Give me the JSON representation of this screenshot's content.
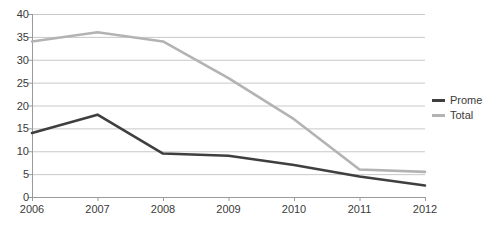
{
  "chart_data": {
    "type": "line",
    "title": "",
    "xlabel": "",
    "ylabel": "",
    "categories": [
      "2006",
      "2007",
      "2008",
      "2009",
      "2010",
      "2011",
      "2012"
    ],
    "x": [
      2006,
      2007,
      2008,
      2009,
      2010,
      2011,
      2012
    ],
    "ylim": [
      0,
      40
    ],
    "y_ticks": [
      0,
      5,
      10,
      15,
      20,
      25,
      30,
      35,
      40
    ],
    "y_tick_labels": [
      "0",
      "5",
      "10",
      "15",
      "20",
      "25",
      "30",
      "35",
      "40"
    ],
    "grid": "horizontal",
    "legend_position": "right",
    "series": [
      {
        "name": "Prome",
        "color": "#3f3f3f",
        "values": [
          14,
          18,
          9.5,
          9,
          7,
          4.5,
          2.5
        ]
      },
      {
        "name": "Total",
        "color": "#b3b3b3",
        "values": [
          34,
          36,
          34,
          26,
          17,
          6,
          5.5
        ]
      }
    ]
  },
  "legend": {
    "items": [
      {
        "label": "Prome",
        "color": "#3f3f3f"
      },
      {
        "label": "Total",
        "color": "#b3b3b3"
      }
    ]
  },
  "colors": {
    "axis": "#9a9a9a",
    "grid": "#c8c8c8",
    "text": "#3a3a3a",
    "background": "#ffffff",
    "series_promedio": "#3f3f3f",
    "series_total": "#b3b3b3"
  }
}
